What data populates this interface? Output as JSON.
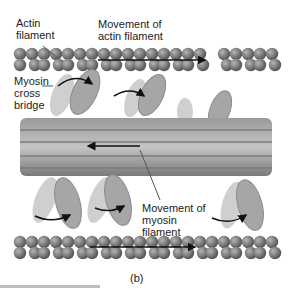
{
  "labels": {
    "actin_filament": [
      "Actin",
      "filament"
    ],
    "movement_actin": [
      "Movement of",
      "actin filament"
    ],
    "myosin_cross_bridge": [
      "Myosin",
      "cross",
      "bridge"
    ],
    "movement_myosin": [
      "Movement of",
      "myosin",
      "filament"
    ],
    "panel": "(b)"
  },
  "colors": {
    "bead": "#6f6f6f",
    "bead_highlight": "#a8a8a8",
    "filament": "#8a8a8a",
    "head": "#a0a0a0",
    "arrow": "#111111"
  }
}
